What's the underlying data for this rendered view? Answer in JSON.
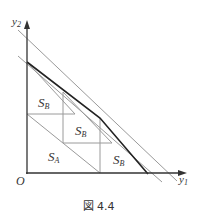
{
  "figure": {
    "caption": "図 4.4",
    "axes": {
      "x_label_main": "y",
      "x_label_sub": "1",
      "y_label_main": "y",
      "y_label_sub": "2",
      "origin_label": "O"
    },
    "regions": [
      {
        "main": "S",
        "sub": "B",
        "position": "upper-left"
      },
      {
        "main": "S",
        "sub": "B",
        "position": "center"
      },
      {
        "main": "S",
        "sub": "A",
        "position": "lower-left"
      },
      {
        "main": "S",
        "sub": "B",
        "position": "lower-right"
      }
    ],
    "colors": {
      "axis": "#333333",
      "thin_line": "#9a9a9a",
      "thick_line": "#222222"
    }
  }
}
